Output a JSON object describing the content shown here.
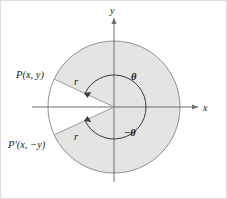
{
  "figure": {
    "background_color": "#ffffff",
    "frame_color": "#d9d9d9",
    "sector_fill": "#e3e3e3",
    "circle_stroke": "#8a8a8a",
    "axis_stroke": "#6e6e6e",
    "ray_stroke": "#9a9a9a",
    "arc_stroke": "#3a3a3a",
    "text_color": "#1b1b1b"
  },
  "axes": {
    "x_label": "x",
    "y_label": "y",
    "origin_x": 114,
    "origin_y": 107
  },
  "circle": {
    "radius": 66,
    "inner_arc_radius": 32
  },
  "points": [
    {
      "id": "upper-point",
      "label": "P(x, y)",
      "angle_deg": 155,
      "radius_label": "r"
    },
    {
      "id": "lower-point",
      "label": "P'(x, −y)",
      "angle_deg": -155,
      "radius_label": "r"
    }
  ],
  "angles": [
    {
      "id": "positive-angle",
      "label": "θ",
      "value_deg": 155,
      "direction": "counterclockwise"
    },
    {
      "id": "negative-angle",
      "label": "−θ",
      "value_deg": -155,
      "direction": "clockwise"
    }
  ],
  "radius_labels": {
    "upper": "r",
    "lower": "r"
  }
}
